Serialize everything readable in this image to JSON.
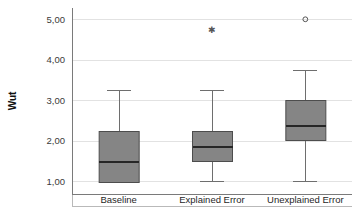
{
  "chart_data": {
    "type": "box",
    "title": "",
    "xlabel": "",
    "ylabel": "Wut",
    "ylim": [
      0.78,
      5.18
    ],
    "grid": true,
    "legend": "none",
    "decimal_separator": ",",
    "y_ticks": [
      {
        "value": 1.0,
        "label": "1,00"
      },
      {
        "value": 2.0,
        "label": "2,00"
      },
      {
        "value": 3.0,
        "label": "3,00"
      },
      {
        "value": 4.0,
        "label": "4,00"
      },
      {
        "value": 5.0,
        "label": "5,00"
      }
    ],
    "categories": [
      "Baseline",
      "Explained Error",
      "Unexplained Error"
    ],
    "boxes": [
      {
        "category": "Baseline",
        "min": 1.0,
        "q1": 1.0,
        "median": 1.5,
        "q3": 2.25,
        "max": 3.25,
        "lower_whisker": 1.0,
        "upper_whisker": 3.25,
        "outliers": [],
        "extreme_outliers": []
      },
      {
        "category": "Explained Error",
        "min": 1.0,
        "q1": 1.5,
        "median": 1.88,
        "q3": 2.25,
        "max": 3.25,
        "lower_whisker": 1.0,
        "upper_whisker": 3.25,
        "outliers": [],
        "extreme_outliers": [
          4.75
        ]
      },
      {
        "category": "Unexplained Error",
        "min": 1.0,
        "q1": 2.0,
        "median": 2.38,
        "q3": 3.0,
        "max": 3.75,
        "lower_whisker": 1.0,
        "upper_whisker": 3.75,
        "outliers": [
          5.0
        ],
        "extreme_outliers": []
      }
    ],
    "colors": {
      "box_fill": "#858585",
      "box_stroke": "#4d4d4d",
      "median": "#262626",
      "whisker": "#6e6e6e",
      "gridline": "#e2e2e2",
      "axis": "#7a7a7a",
      "background": "#ffffff",
      "text": "#1f1f1f"
    }
  }
}
